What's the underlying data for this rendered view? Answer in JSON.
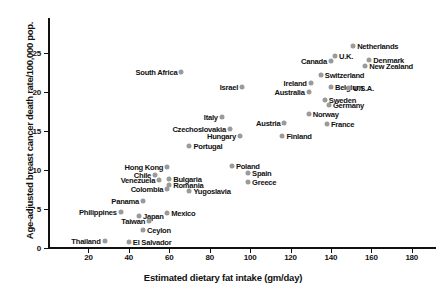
{
  "chart_data": {
    "type": "scatter",
    "title": "",
    "xlabel": "Estimated dietary fat intake (gm/day)",
    "ylabel": "Age-adjusted breast cancer death rate/100,000 pop.",
    "xlim": [
      0,
      192
    ],
    "ylim": [
      0,
      27
    ],
    "xticks": [
      20,
      40,
      60,
      80,
      100,
      120,
      140,
      160,
      180
    ],
    "yticks": [
      0,
      5,
      10,
      15,
      20,
      25
    ],
    "grid": false,
    "legend": null,
    "marker_color": "#9a9a9a",
    "axis_color": "#111111",
    "points": [
      {
        "label": "Netherlands",
        "x": 151,
        "y": 25.9,
        "side": "right"
      },
      {
        "label": "U.K.",
        "x": 142,
        "y": 24.6,
        "side": "right"
      },
      {
        "label": "Denmark",
        "x": 159,
        "y": 24.1,
        "side": "right"
      },
      {
        "label": "Canada",
        "x": 140,
        "y": 23.9,
        "side": "left"
      },
      {
        "label": "New Zealand",
        "x": 157,
        "y": 23.3,
        "side": "right"
      },
      {
        "label": "South Africa",
        "x": 66,
        "y": 22.5,
        "side": "left"
      },
      {
        "label": "Switzerland",
        "x": 135,
        "y": 22.1,
        "side": "right"
      },
      {
        "label": "Ireland",
        "x": 130,
        "y": 21.1,
        "side": "left"
      },
      {
        "label": "Belgium",
        "x": 140,
        "y": 20.6,
        "side": "right"
      },
      {
        "label": "Israel",
        "x": 96,
        "y": 20.6,
        "side": "left"
      },
      {
        "label": "U.S.A.",
        "x": 149,
        "y": 20.5,
        "side": "right"
      },
      {
        "label": "Australia",
        "x": 129,
        "y": 19.9,
        "side": "left"
      },
      {
        "label": "Sweden",
        "x": 137,
        "y": 19.0,
        "side": "right"
      },
      {
        "label": "Germany",
        "x": 139,
        "y": 18.3,
        "side": "right"
      },
      {
        "label": "Norway",
        "x": 129,
        "y": 17.1,
        "side": "right"
      },
      {
        "label": "Italy",
        "x": 86,
        "y": 16.7,
        "side": "left"
      },
      {
        "label": "Austria",
        "x": 117,
        "y": 16.0,
        "side": "left"
      },
      {
        "label": "France",
        "x": 138,
        "y": 15.9,
        "side": "right"
      },
      {
        "label": "Czechoslovakia",
        "x": 90,
        "y": 15.2,
        "side": "left"
      },
      {
        "label": "Hungary",
        "x": 95,
        "y": 14.3,
        "side": "left"
      },
      {
        "label": "Finland",
        "x": 116,
        "y": 14.3,
        "side": "right"
      },
      {
        "label": "Portugal",
        "x": 70,
        "y": 13.1,
        "side": "right"
      },
      {
        "label": "Poland",
        "x": 91,
        "y": 10.5,
        "side": "right"
      },
      {
        "label": "Hong Kong",
        "x": 59,
        "y": 10.4,
        "side": "left"
      },
      {
        "label": "Spain",
        "x": 99,
        "y": 9.6,
        "side": "right"
      },
      {
        "label": "Chile",
        "x": 53,
        "y": 9.3,
        "side": "left"
      },
      {
        "label": "Bulgaria",
        "x": 60,
        "y": 8.8,
        "side": "right"
      },
      {
        "label": "Venezuela",
        "x": 55,
        "y": 8.7,
        "side": "left"
      },
      {
        "label": "Greece",
        "x": 99,
        "y": 8.4,
        "side": "right"
      },
      {
        "label": "Romania",
        "x": 60,
        "y": 8.0,
        "side": "right"
      },
      {
        "label": "Colombia",
        "x": 59,
        "y": 7.6,
        "side": "left"
      },
      {
        "label": "Yugoslavia",
        "x": 70,
        "y": 7.3,
        "side": "right"
      },
      {
        "label": "Panama",
        "x": 47,
        "y": 6.0,
        "side": "left"
      },
      {
        "label": "Philippines",
        "x": 36,
        "y": 4.6,
        "side": "left"
      },
      {
        "label": "Mexico",
        "x": 59,
        "y": 4.5,
        "side": "right"
      },
      {
        "label": "Japan",
        "x": 45,
        "y": 4.1,
        "side": "right"
      },
      {
        "label": "Taiwan",
        "x": 50,
        "y": 3.5,
        "side": "left"
      },
      {
        "label": "Ceylon",
        "x": 47,
        "y": 2.3,
        "side": "right"
      },
      {
        "label": "Thailand",
        "x": 28,
        "y": 0.9,
        "side": "left"
      },
      {
        "label": "El Salvador",
        "x": 40,
        "y": 0.8,
        "side": "right"
      }
    ]
  }
}
